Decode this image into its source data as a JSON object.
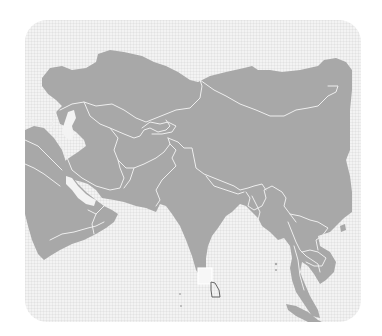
{
  "map": {
    "region": "Asia",
    "highlighted_country": "Sri Lanka",
    "colors": {
      "background": "#ffffff",
      "panel": "#f3f3f3",
      "land": "#a8a8a8",
      "borders": "#eeeeee",
      "highlight_outline": "#555555"
    }
  }
}
